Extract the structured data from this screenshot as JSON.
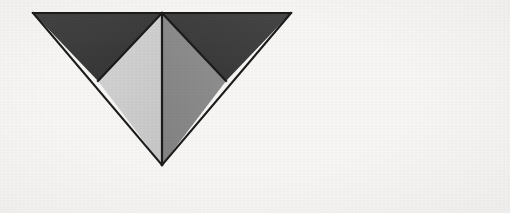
{
  "figure": {
    "background_color": "#f8f7f5",
    "outline_color": "#1c1c1c",
    "outline_width": 2.2,
    "canvas": {
      "width": 510,
      "height": 213
    },
    "vertices": {
      "top_left": {
        "x": 33,
        "y": 13
      },
      "top_right": {
        "x": 291,
        "y": 13
      },
      "top_center": {
        "x": 162,
        "y": 13
      },
      "bottom_apex": {
        "x": 162,
        "y": 165
      },
      "left_edge_midpoint": {
        "x": 98,
        "y": 81
      },
      "right_edge_midpoint": {
        "x": 226,
        "y": 81
      }
    },
    "facets": [
      {
        "name": "upper-left-facet",
        "label": "Upper left dark triangle",
        "fill": "#3b3b3b",
        "points": "33,13 162,13 98,81"
      },
      {
        "name": "upper-right-facet",
        "label": "Upper right dark triangle",
        "fill": "#3d3d3d",
        "points": "162,13 291,13 226,81"
      },
      {
        "name": "lower-left-facet",
        "label": "Lower left light triangle",
        "fill": "#cfcfcf",
        "points": "98,81 162,13 162,165"
      },
      {
        "name": "lower-right-facet",
        "label": "Lower right medium gray triangle",
        "fill": "#8b8b8b",
        "points": "162,13 226,81 162,165"
      }
    ],
    "edges": [
      {
        "name": "top-edge",
        "x1": 33,
        "y1": 13,
        "x2": 291,
        "y2": 13
      },
      {
        "name": "left-outer-edge",
        "x1": 33,
        "y1": 13,
        "x2": 162,
        "y2": 165
      },
      {
        "name": "right-outer-edge",
        "x1": 291,
        "y1": 13,
        "x2": 162,
        "y2": 165
      },
      {
        "name": "left-inner-diagonal",
        "x1": 162,
        "y1": 13,
        "x2": 98,
        "y2": 81
      },
      {
        "name": "right-inner-diagonal",
        "x1": 162,
        "y1": 13,
        "x2": 226,
        "y2": 81
      },
      {
        "name": "center-vertical-axis",
        "x1": 162,
        "y1": 13,
        "x2": 162,
        "y2": 165
      }
    ]
  }
}
